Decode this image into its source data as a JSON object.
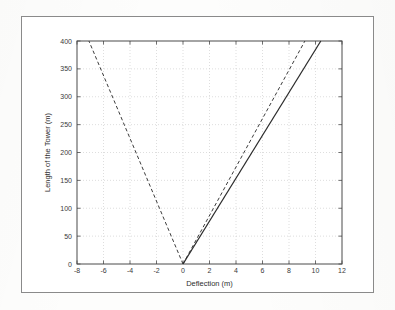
{
  "figure": {
    "background_color": "#fdfdfc",
    "frame_color": "#8a8a8a",
    "plot_background": "#ffffff"
  },
  "chart_data": {
    "type": "line",
    "title": "",
    "xlabel": "Deflection (m)",
    "ylabel": "Length of the Tower (m)",
    "xlim": [
      -8,
      12
    ],
    "ylim": [
      0,
      400
    ],
    "xticks": [
      -8,
      -6,
      -4,
      -2,
      0,
      2,
      4,
      6,
      8,
      10,
      12
    ],
    "xticklabels": [
      "-8",
      "-6",
      "-4",
      "-2",
      "0",
      "2",
      "4",
      "6",
      "8",
      "10",
      "12"
    ],
    "yticks": [
      0,
      50,
      100,
      150,
      200,
      250,
      300,
      350,
      400
    ],
    "yticklabels": [
      "0",
      "50",
      "100",
      "150",
      "200",
      "250",
      "300",
      "350",
      "400"
    ],
    "grid": true,
    "grid_style": "dotted",
    "grid_color": "#c8c8c8",
    "legend": null,
    "legend_position": "none",
    "series": [
      {
        "name": "left-dashed-deflection",
        "style": "dashed",
        "color": "#3c3c3c",
        "x": [
          0,
          -7.1
        ],
        "y": [
          0,
          400
        ]
      },
      {
        "name": "right-dashed-deflection",
        "style": "dashed",
        "color": "#3c3c3c",
        "x": [
          0,
          9.2
        ],
        "y": [
          0,
          400
        ]
      },
      {
        "name": "solid-deflection",
        "style": "solid",
        "color": "#2b2b2b",
        "x": [
          0,
          10.4
        ],
        "y": [
          0,
          400
        ]
      }
    ]
  }
}
